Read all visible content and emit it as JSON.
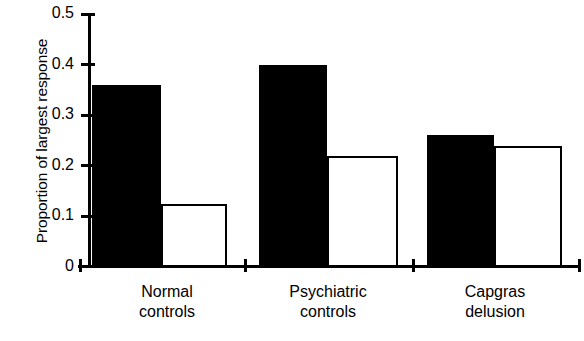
{
  "chart_data": {
    "type": "bar",
    "title": "",
    "subtitle": "",
    "xlabel": "",
    "ylabel": "Proportion of largest response",
    "categories": [
      "Normal controls",
      "Psychiatric controls",
      "Capgras delusion"
    ],
    "category_lines": [
      [
        "Normal",
        "controls"
      ],
      [
        "Psychiatric",
        "controls"
      ],
      [
        "Capgras",
        "delusion"
      ]
    ],
    "series": [
      {
        "name": "filled",
        "style": "solid-black",
        "color": "#000000",
        "values": [
          0.36,
          0.4,
          0.26
        ]
      },
      {
        "name": "open",
        "style": "open-white",
        "color": "#ffffff",
        "values": [
          0.125,
          0.22,
          0.24
        ]
      }
    ],
    "ylim": [
      0,
      0.5
    ],
    "ytick_values": [
      0.5,
      0.4,
      0.3,
      0.2,
      0.1,
      0
    ],
    "ytick_labels": [
      "0.5",
      "0.4",
      "0.3",
      "0.2",
      "0.1",
      "0"
    ],
    "grid": false,
    "legend": "none",
    "axis_color": "#000000",
    "background": "#ffffff"
  }
}
